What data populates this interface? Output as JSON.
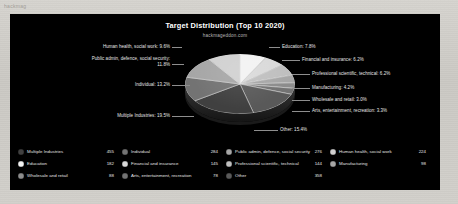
{
  "page": {
    "corner_mark": "hackmag"
  },
  "chart": {
    "title": "Target Distribution (Top 10 2020)",
    "subtitle": "hackmageddon.com",
    "background": "#000000"
  },
  "chart_data": {
    "type": "pie",
    "title": "Target Distribution (Top 10 2020)",
    "subtitle": "hackmageddon.com",
    "xlabel": "",
    "ylabel": "",
    "legend_position": "bottom",
    "grid": false,
    "labels": [
      "Education",
      "Financial and insurance",
      "Professional scientific, technical",
      "Manufacturing",
      "Wholesale and retail",
      "Arts, entertainment, recreation",
      "Other",
      "Multiple Industries",
      "Individual",
      "Public admin, defence, social security",
      "Human health, social work"
    ],
    "percentages": [
      7.8,
      6.2,
      6.2,
      4.2,
      3.0,
      3.3,
      15.4,
      19.5,
      13.2,
      11.8,
      9.6
    ],
    "counts": [
      182,
      145,
      144,
      98,
      88,
      78,
      358,
      455,
      284,
      276,
      224
    ],
    "colors": [
      "#f2f2f2",
      "#d9d9d9",
      "#bfbfbf",
      "#a6a6a6",
      "#8c8c8c",
      "#737373",
      "#595959",
      "#404040",
      "#737373",
      "#a6a6a6",
      "#d0d0d0"
    ]
  },
  "callouts": [
    {
      "text": "Human health, social work: 9.6%"
    },
    {
      "text": "Public admin, defence, social security: 11.8%"
    },
    {
      "text": "Individual: 13.2%"
    },
    {
      "text": "Multiple Industries: 19.5%"
    },
    {
      "text": "Education: 7.8%"
    },
    {
      "text": "Financial and insurance: 6.2%"
    },
    {
      "text": "Professional scientific, technical: 6.2%"
    },
    {
      "text": "Manufacturing: 4.2%"
    },
    {
      "text": "Wholesale and retail: 3.0%"
    },
    {
      "text": "Arts, entertainment, recreation: 3.3%"
    },
    {
      "text": "Other: 15.4%"
    }
  ],
  "legend": {
    "rows": [
      [
        {
          "label": "Multiple Industries",
          "value": "455",
          "color": "#404040"
        },
        {
          "label": "Individual",
          "value": "284",
          "color": "#737373"
        },
        {
          "label": "Public admin, defence, social security",
          "value": "276",
          "color": "#a6a6a6"
        },
        {
          "label": "Human health, social work",
          "value": "224",
          "color": "#d0d0d0"
        }
      ],
      [
        {
          "label": "Education",
          "value": "182",
          "color": "#f2f2f2"
        },
        {
          "label": "Financial and insurance",
          "value": "145",
          "color": "#d9d9d9"
        },
        {
          "label": "Professional scientific, technical",
          "value": "144",
          "color": "#bfbfbf"
        },
        {
          "label": "Manufacturing",
          "value": "98",
          "color": "#a6a6a6"
        }
      ],
      [
        {
          "label": "Wholesale and retail",
          "value": "88",
          "color": "#8c8c8c"
        },
        {
          "label": "Arts, entertainment, recreation",
          "value": "78",
          "color": "#737373"
        },
        {
          "label": "Other",
          "value": "358",
          "color": "#595959"
        }
      ]
    ]
  }
}
